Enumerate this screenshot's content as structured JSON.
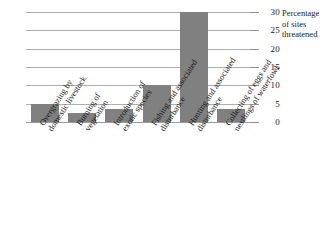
{
  "chart_data": {
    "type": "bar",
    "title": "",
    "xlabel": "",
    "ylabel": "Percentage of sites threatened",
    "ylim": [
      0,
      30
    ],
    "grid": true,
    "legend": false,
    "categories": [
      "Overgrazing by domestic livestock",
      "Burning of vegetation",
      "Introduction of exotic species",
      "Fishing and associated disturbance",
      "Hunting and associated disturbance",
      "Collecting of eggs and nestlings of waterfowl"
    ],
    "category_lines": [
      [
        "Overgrazing by",
        "domestic livestock"
      ],
      [
        "Burning of",
        "vegetation"
      ],
      [
        "Introduction of",
        "exotic species"
      ],
      [
        "Fishing and associated",
        "disturbance"
      ],
      [
        "Hunting and associated",
        "disturbance"
      ],
      [
        "Collecting of eggs and",
        "nestlings of waterfowl"
      ]
    ],
    "values": [
      5,
      2.5,
      3.5,
      10,
      30,
      3.5
    ],
    "yticks": [
      30,
      25,
      20,
      15,
      10,
      5,
      0
    ],
    "bar_color": "#808080",
    "gridline_color": "#aeaeae"
  },
  "axis_title": {
    "line1": "Percentage",
    "line2": "of sites",
    "line3": "threatened"
  }
}
